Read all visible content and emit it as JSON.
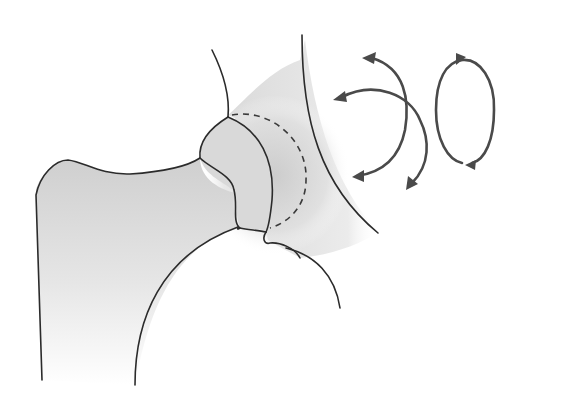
{
  "figure": {
    "colors": {
      "outline": "#2b2b2b",
      "arrows": "#4a4a4a",
      "shade": "#c8c8c8",
      "background": "#ffffff"
    },
    "elements": [
      "femur-shaft",
      "femoral-neck",
      "femoral-head",
      "pelvis-acetabulum",
      "acetabular-rim-dashed",
      "rotation-arrows-crossed",
      "circumduction-arrow-loop"
    ]
  }
}
